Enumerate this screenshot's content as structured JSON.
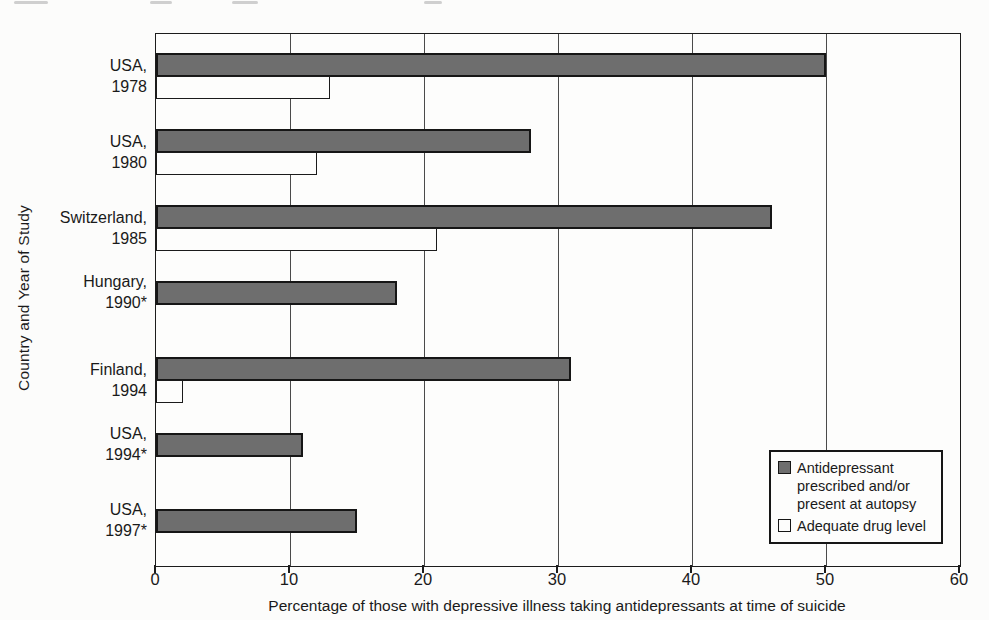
{
  "colors": {
    "bar_dark": "#6e6e6e",
    "bar_white": "#fdfdfc",
    "bar_border": "#161616",
    "background": "#fcfcfb",
    "text": "#1a1a1a"
  },
  "chart_data": {
    "type": "bar",
    "orientation": "horizontal",
    "title": "",
    "xlabel": "Percentage of those with depressive illness taking antidepressants at time of suicide",
    "ylabel": "Country and Year of Study",
    "xlim": [
      0,
      60
    ],
    "xticks": [
      0,
      10,
      20,
      30,
      40,
      50,
      60
    ],
    "grid": "vertical",
    "legend_position": "lower-right",
    "categories": [
      "USA, 1978",
      "USA, 1980",
      "Switzerland, 1985",
      "Hungary, 1990*",
      "Finland, 1994",
      "USA, 1994*",
      "USA, 1997*"
    ],
    "category_label_lines": [
      [
        "USA,",
        "1978"
      ],
      [
        "USA,",
        "1980"
      ],
      [
        "Switzerland,",
        "1985"
      ],
      [
        "Hungary,",
        "1990*"
      ],
      [
        "Finland,",
        "1994"
      ],
      [
        "USA,",
        "1994*"
      ],
      [
        "USA,",
        "1997*"
      ]
    ],
    "series": [
      {
        "name": "Antidepressant prescribed and/or present at autopsy",
        "color": "#6e6e6e",
        "values": [
          50,
          28,
          46,
          18,
          31,
          11,
          15
        ]
      },
      {
        "name": "Adequate drug level",
        "color": "#fdfdfc",
        "values": [
          13,
          12,
          21,
          null,
          2,
          null,
          null
        ]
      }
    ]
  }
}
